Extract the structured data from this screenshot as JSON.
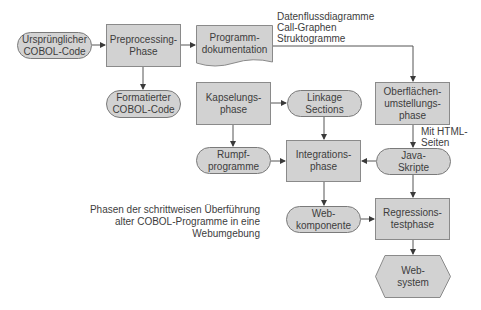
{
  "diagram": {
    "caption": "Phasen der schrittweisen Überführung\nalter COBOL-Programme in eine\nWebumgebung",
    "colors": {
      "fill": "#d2d2d2",
      "border": "#8a8a8a",
      "connector": "#555555",
      "text": "#3d3d3d"
    },
    "nodes": {
      "original_code": {
        "label": "Ursprünglicher\nCOBOL-Code",
        "shape": "terminator"
      },
      "preprocessing": {
        "label": "Preprocessing-\nPhase",
        "shape": "process"
      },
      "documentation": {
        "label": "Programm-\ndokumentation",
        "shape": "document"
      },
      "formatted_code": {
        "label": "Formatierter\nCOBOL-Code",
        "shape": "terminator"
      },
      "encapsulation": {
        "label": "Kapselungs-\nphase",
        "shape": "process"
      },
      "linkage": {
        "label": "Linkage\nSections",
        "shape": "terminator"
      },
      "ui_conversion": {
        "label": "Oberflächen-\numstellungs-\nphase",
        "shape": "process"
      },
      "stub_programs": {
        "label": "Rumpf-\nprogramme",
        "shape": "terminator"
      },
      "integration": {
        "label": "Integrations-\nphase",
        "shape": "process"
      },
      "java_scripts": {
        "label": "Java-\nSkripte",
        "shape": "terminator"
      },
      "web_component": {
        "label": "Web-\nkomponente",
        "shape": "terminator"
      },
      "regression_test": {
        "label": "Regressions-\ntestphase",
        "shape": "process"
      },
      "web_system": {
        "label": "Web-\nsystem",
        "shape": "hexagon"
      }
    },
    "edge_labels": {
      "doc_outputs": "Datenflussdiagramme\nCall-Graphen\nStruktogramme",
      "html_pages": "Mit HTML-\nSeiten"
    },
    "edges": [
      {
        "from": "original_code",
        "to": "preprocessing"
      },
      {
        "from": "preprocessing",
        "to": "documentation"
      },
      {
        "from": "preprocessing",
        "to": "formatted_code"
      },
      {
        "from": "documentation",
        "to": "ui_conversion"
      },
      {
        "from": "encapsulation",
        "to": "linkage"
      },
      {
        "from": "encapsulation",
        "to": "stub_programs"
      },
      {
        "from": "linkage",
        "to": "integration"
      },
      {
        "from": "stub_programs",
        "to": "integration"
      },
      {
        "from": "ui_conversion",
        "to": "java_scripts"
      },
      {
        "from": "java_scripts",
        "to": "integration"
      },
      {
        "from": "java_scripts",
        "to": "regression_test"
      },
      {
        "from": "integration",
        "to": "web_component"
      },
      {
        "from": "web_component",
        "to": "regression_test"
      },
      {
        "from": "regression_test",
        "to": "web_system"
      }
    ]
  }
}
